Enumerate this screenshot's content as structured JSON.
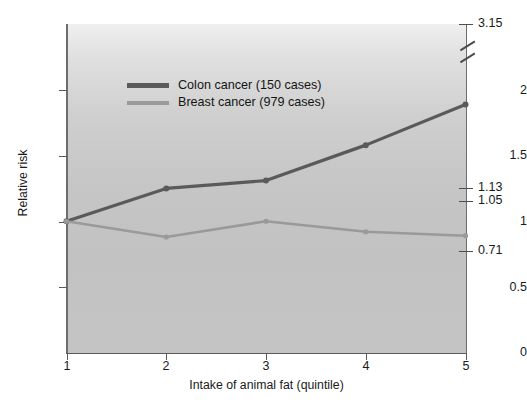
{
  "figure": {
    "background_color": "#ffffff",
    "plot_background": "#c6c6c6"
  },
  "chart_data": {
    "type": "line",
    "title": "",
    "xlabel": "Intake of animal fat (quintile)",
    "ylabel": "Relative risk",
    "categories": [
      "1",
      "2",
      "3",
      "4",
      "5"
    ],
    "x": [
      1,
      2,
      3,
      4,
      5
    ],
    "xlim": [
      1,
      5
    ],
    "ylim": [
      0,
      2.5
    ],
    "grid": false,
    "legend_position": "upper left",
    "series": [
      {
        "name": "Colon cancer (150 cases)",
        "color": "#5a5a5a",
        "values": [
          1.0,
          1.25,
          1.31,
          1.58,
          1.89
        ]
      },
      {
        "name": "Breast cancer (979 cases)",
        "color": "#9a9a9a",
        "values": [
          1.0,
          0.88,
          1.0,
          0.92,
          0.89
        ]
      }
    ],
    "yticks": [
      0,
      0.5,
      1,
      1.5,
      2
    ],
    "ytick_labels": [
      "0",
      "0.5",
      "1",
      "1.5",
      "2"
    ],
    "xticks": [
      1,
      2,
      3,
      4,
      5
    ],
    "xtick_labels": [
      "1",
      "2",
      "3",
      "4",
      "5"
    ],
    "right_axis_annotations": [
      {
        "label": "3.15",
        "value": 3.15,
        "note": "above axis break"
      },
      {
        "label": "1.13",
        "value": 1.13
      },
      {
        "label": "1.05",
        "value": 1.05
      },
      {
        "label": "0.71",
        "value": 0.71
      }
    ],
    "axis_break": true
  },
  "legend": {
    "items": [
      {
        "label": "Colon cancer (150 cases)",
        "swatch": "colon"
      },
      {
        "label": "Breast cancer (979 cases)",
        "swatch": "breast"
      }
    ]
  },
  "axes": {
    "y_title": "Relative risk",
    "x_title": "Intake of animal fat (quintile)",
    "y_labels": [
      "2",
      "1.5",
      "1",
      "0.5",
      "0"
    ],
    "x_labels": [
      "1",
      "2",
      "3",
      "4",
      "5"
    ],
    "right_labels": [
      "3.15",
      "1.13",
      "1.05",
      "0.71"
    ]
  }
}
